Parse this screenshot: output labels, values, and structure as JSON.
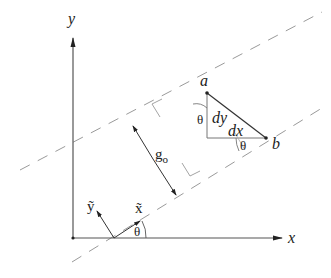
{
  "diagram": {
    "axes": {
      "x_label": "x",
      "y_label": "y"
    },
    "points": {
      "a_label": "a",
      "b_label": "b"
    },
    "segments": {
      "dx_label": "dx",
      "dy_label": "dy"
    },
    "width_label": "g",
    "width_subscript": "o",
    "rotated_axes": {
      "x_tilde_label": "x̃",
      "y_tilde_label": "ỹ"
    },
    "angles": {
      "theta_at_origin": "θ",
      "theta_at_a": "θ",
      "theta_at_b": "θ"
    },
    "colors": {
      "line": "#333333",
      "dash": "#9a9a9a",
      "text": "#222222",
      "background": "#ffffff"
    }
  }
}
